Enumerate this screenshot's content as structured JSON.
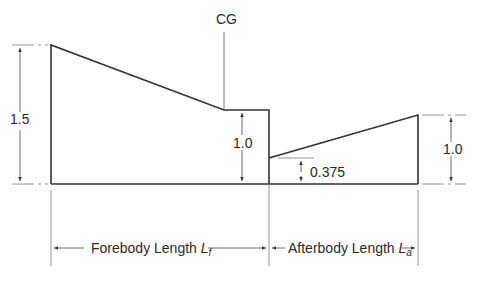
{
  "diagram": {
    "cg_label": "CG",
    "dims": {
      "forebody_height": "1.5",
      "step_height": "1.0",
      "afterbody_height": "1.0",
      "afterbody_start_height": "0.375"
    },
    "lengths": {
      "forebody_label": "Forebody Length ",
      "forebody_symbol": "L",
      "forebody_sub": "f",
      "afterbody_label": "Afterbody Length ",
      "afterbody_symbol": "L",
      "afterbody_sub": "a"
    }
  }
}
